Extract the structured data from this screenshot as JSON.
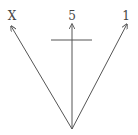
{
  "diagram": {
    "type": "vector-arrows",
    "stroke_color": "#555555",
    "origin": {
      "x": 72,
      "y": 129
    },
    "arrows": [
      {
        "label": "X",
        "tip": {
          "x": 11,
          "y": 26
        },
        "label_pos": {
          "x": 12,
          "y": 20
        }
      },
      {
        "label": "5",
        "tip": {
          "x": 72,
          "y": 24
        },
        "label_pos": {
          "x": 72,
          "y": 20
        }
      },
      {
        "label": "1",
        "tip": {
          "x": 127,
          "y": 24
        },
        "label_pos": {
          "x": 126,
          "y": 20
        }
      }
    ],
    "crossbar": {
      "x1": 51,
      "x2": 92,
      "y": 40
    }
  }
}
